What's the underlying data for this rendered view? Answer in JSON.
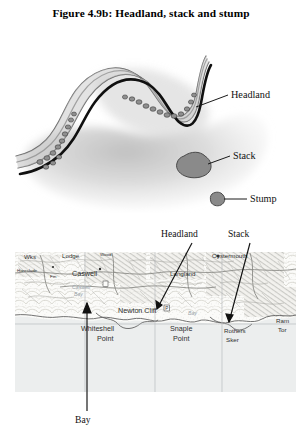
{
  "figure": {
    "title": "Figure 4.9b: Headland, stack and stump"
  },
  "diagram": {
    "type": "coastal-erosion-landform-diagram",
    "labels": {
      "headland": "Headland",
      "stack": "Stack",
      "stump": "Stump"
    },
    "colors": {
      "sea_shade": "#d9d9d9",
      "land_band": "#c9c9c9",
      "rock_outline": "#1a1a1a",
      "stack_fill": "#8a8a8a",
      "stack_outline": "#4a4a4a"
    }
  },
  "map": {
    "callouts": {
      "headland": "Headland",
      "stack": "Stack",
      "bay": "Bay"
    },
    "places": [
      "Wks",
      "Lodge",
      "Caswell",
      "Fm",
      "Caswell Bay",
      "Newton Cliff",
      "Whiteshell Point",
      "Snaple Point",
      "Rothers Sker",
      "Langland",
      "Oystermouth",
      "Ram Tor",
      "Bay"
    ],
    "colors": {
      "sea": "#eceeee",
      "land": "#fbfbf9",
      "grid": "#b9bcbe",
      "ink": "#4a4a4a"
    }
  }
}
